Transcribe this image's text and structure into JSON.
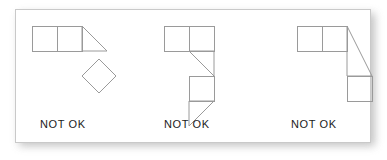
{
  "card": {
    "background": "#ffffff",
    "border_color": "#c9c9c9",
    "shadow_color": "#b9b9b9"
  },
  "stroke": {
    "color": "#9a9a9a",
    "width": 1
  },
  "figures": [
    {
      "id": "figure-1",
      "label": "NOT OK",
      "description": "two squares in a row, a right triangle, and a rotated square (diamond) attached at a corner",
      "parts": [
        {
          "name": "square-left",
          "shape": "square",
          "points": "8,8 33,8 33,33 8,33"
        },
        {
          "name": "square-right",
          "shape": "square",
          "points": "33,8 58,8 58,33 33,33"
        },
        {
          "name": "triangle",
          "shape": "triangle",
          "points": "58,8 83,33 58,33"
        },
        {
          "name": "diamond",
          "shape": "diamond",
          "points": "75,41 92,58 75,75 58,58"
        }
      ]
    },
    {
      "id": "figure-2",
      "label": "NOT OK",
      "description": "two squares in a row, a right triangle, a square, then a right triangle pointing down-left",
      "parts": [
        {
          "name": "square-left",
          "shape": "square",
          "points": "8,8 33,8 33,33 8,33"
        },
        {
          "name": "square-right",
          "shape": "square",
          "points": "33,8 58,8 58,33 33,33"
        },
        {
          "name": "triangle-upper",
          "shape": "triangle",
          "points": "33,33 58,33 58,58"
        },
        {
          "name": "square-middle",
          "shape": "square",
          "points": "33,58 58,58 58,83 33,83"
        },
        {
          "name": "triangle-lower",
          "shape": "triangle",
          "points": "33,83 58,83 33,108"
        }
      ]
    },
    {
      "id": "figure-3",
      "label": "NOT OK",
      "description": "two squares in a row, a tall right triangle spanning two rows, and a square below",
      "parts": [
        {
          "name": "square-left",
          "shape": "square",
          "points": "8,8 33,8 33,33 8,33"
        },
        {
          "name": "square-right",
          "shape": "square",
          "points": "33,8 58,8 58,33 33,33"
        },
        {
          "name": "triangle-tall",
          "shape": "triangle",
          "points": "58,8 83,58 58,58"
        },
        {
          "name": "square-bottom",
          "shape": "square",
          "points": "58,58 83,58 83,83 58,83"
        }
      ]
    }
  ],
  "figure_positions": [
    {
      "left": 15,
      "top": 9
    },
    {
      "left": 147,
      "top": 9
    },
    {
      "left": 280,
      "top": 9
    }
  ]
}
